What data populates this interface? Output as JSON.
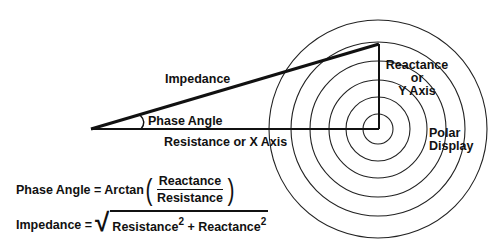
{
  "diagram": {
    "type": "impedance-phase-diagram",
    "labels": {
      "impedance": "Impedance",
      "phase_angle": "Phase Angle",
      "resistance_axis": "Resistance or X Axis",
      "reactance_line1": "Reactance",
      "reactance_line2": "or",
      "reactance_line3": "Y Axis",
      "polar_line1": "Polar",
      "polar_line2": "Display"
    },
    "geometry": {
      "origin": [
        91,
        129
      ],
      "polar_center": [
        378,
        129
      ],
      "apex": [
        379,
        44
      ],
      "circle_radii": [
        15,
        32,
        49,
        68,
        85,
        109
      ]
    },
    "colors": {
      "line": "#111111",
      "background": "#ffffff"
    }
  },
  "formulas": {
    "phase_angle": {
      "lhs": "Phase Angle = Arctan",
      "open_paren": "(",
      "numerator": "Reactance",
      "denominator": "Resistance",
      "close_paren": ")"
    },
    "impedance": {
      "lhs": "Impedance = ",
      "radical": "√",
      "term1": "Resistance",
      "exp1": "2",
      "plus": " + ",
      "term2": "Reactance",
      "exp2": "2"
    }
  }
}
